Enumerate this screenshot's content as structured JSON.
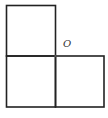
{
  "diagram": {
    "point_label": "O",
    "line_color": "#222222",
    "squares": [
      {
        "name": "top-left",
        "x": 6,
        "y": 5,
        "size": 49
      },
      {
        "name": "bottom-left",
        "x": 6,
        "y": 56,
        "size": 49
      },
      {
        "name": "bottom-right",
        "x": 55,
        "y": 56,
        "size": 49
      }
    ]
  }
}
